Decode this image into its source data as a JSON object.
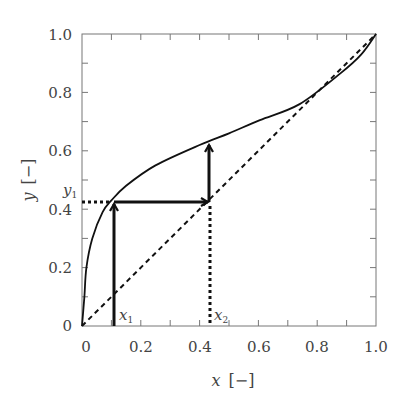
{
  "chart_data": {
    "type": "line",
    "title": "",
    "xlabel": "x [−]",
    "ylabel": "y [−]",
    "xlabel_var": "x",
    "ylabel_var": "y",
    "unit_label": "[−]",
    "xlim": [
      0,
      1.0
    ],
    "ylim": [
      0,
      1.0
    ],
    "grid": false,
    "legend": null,
    "x_ticks": [
      0,
      0.2,
      0.4,
      0.6,
      0.8,
      1.0
    ],
    "x_tick_labels": [
      "0",
      "0.2",
      "0.4",
      "0.6",
      "0.8",
      "1.0"
    ],
    "y_ticks": [
      0,
      0.2,
      0.4,
      0.6,
      0.8,
      1.0
    ],
    "y_tick_labels": [
      "0",
      "0.2",
      "0.4",
      "0.6",
      "0.8",
      "1.0"
    ],
    "minor_tick_step": 0.1,
    "series": [
      {
        "name": "equilibrium curve",
        "style": "solid",
        "x": [
          0,
          0.008,
          0.015,
          0.035,
          0.07,
          0.1,
          0.15,
          0.25,
          0.4,
          0.5,
          0.605,
          0.74,
          0.88,
          0.95,
          1.0
        ],
        "y": [
          0,
          0.1,
          0.2,
          0.3,
          0.39,
          0.43,
          0.48,
          0.55,
          0.62,
          0.66,
          0.705,
          0.76,
          0.866,
          0.93,
          1.0
        ]
      },
      {
        "name": "diagonal y=x",
        "style": "dashed",
        "x": [
          0,
          1.0
        ],
        "y": [
          0,
          1.0
        ]
      }
    ],
    "annotations": [
      {
        "type": "arrow",
        "from": [
          0.109,
          0
        ],
        "to": [
          0.109,
          0.425
        ],
        "label": ""
      },
      {
        "type": "arrow",
        "from": [
          0.109,
          0.425
        ],
        "to": [
          0.435,
          0.425
        ],
        "label": ""
      },
      {
        "type": "arrow",
        "from": [
          0.435,
          0.425
        ],
        "to": [
          0.435,
          0.627
        ],
        "label": ""
      },
      {
        "type": "dotted",
        "from": [
          0,
          0.425
        ],
        "to": [
          0.109,
          0.425
        ]
      },
      {
        "type": "dotted",
        "from": [
          0.435,
          0
        ],
        "to": [
          0.435,
          0.425
        ]
      },
      {
        "type": "text",
        "text": "x",
        "sub": "1",
        "at": [
          0.109,
          0.02
        ]
      },
      {
        "type": "text",
        "text": "x",
        "sub": "2",
        "at": [
          0.435,
          0.02
        ]
      },
      {
        "type": "text",
        "text": "y",
        "sub": "1",
        "at": [
          0,
          0.425
        ]
      }
    ],
    "points": {
      "x1": 0.109,
      "x2": 0.435,
      "y1": 0.425,
      "y2": 0.627
    }
  },
  "labels": {
    "x_var": "x",
    "y_var": "y",
    "unit": "[−]",
    "x1_main": "x",
    "x1_sub": "1",
    "x2_main": "x",
    "x2_sub": "2",
    "y1_main": "y",
    "y1_sub": "1",
    "xt0": "0",
    "xt1": "0.2",
    "xt2": "0.4",
    "xt3": "0.6",
    "xt4": "0.8",
    "xt5": "1.0",
    "yt0": "0",
    "yt1": "0.2",
    "yt2": "0.4",
    "yt3": "0.6",
    "yt4": "0.8",
    "yt5": "1.0"
  },
  "colors": {
    "line": "#111111",
    "axis": "#666666",
    "text": "#444444"
  }
}
